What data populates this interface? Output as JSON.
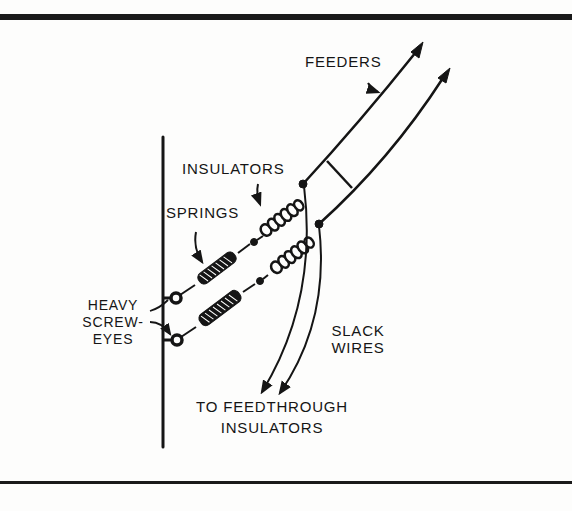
{
  "diagram": {
    "labels": {
      "feeders": "FEEDERS",
      "insulators": "INSULATORS",
      "springs": "SPRINGS",
      "heavy_screw_eyes": [
        "HEAVY",
        "SCREW-",
        "EYES"
      ],
      "slack_wires": [
        "SLACK",
        "WIRES"
      ],
      "to_feedthrough": [
        "TO FEEDTHROUGH",
        "INSULATORS"
      ]
    },
    "colors": {
      "ink": "#151515",
      "background": "#fdfdfc"
    },
    "components": [
      "wall",
      "heavy-screw-eye",
      "spring",
      "insulator",
      "feeder-wire",
      "spreader",
      "slack-wire"
    ]
  }
}
